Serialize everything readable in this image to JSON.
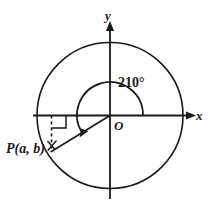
{
  "figure": {
    "type": "unit-circle-angle-diagram",
    "background_color": "#ffffff",
    "stroke_color": "#1a1a1a",
    "axes": {
      "x_label": "x",
      "y_label": "y",
      "origin_label": "O"
    },
    "angle": {
      "label": "210°",
      "value_degrees": 210,
      "direction": "counterclockwise",
      "start_ray": "positive-x-axis",
      "arrow_at": "terminal-side"
    },
    "point": {
      "label_prefix": "P",
      "label": "P(a, b)",
      "coordinate_a": "a",
      "coordinate_b": "b",
      "quadrant": 3
    },
    "circle": {
      "center_label": "O",
      "radius_px": 73
    },
    "markers": {
      "right_angle": "right-angle-square",
      "perpendicular": "dashed-vertical-segment"
    }
  }
}
